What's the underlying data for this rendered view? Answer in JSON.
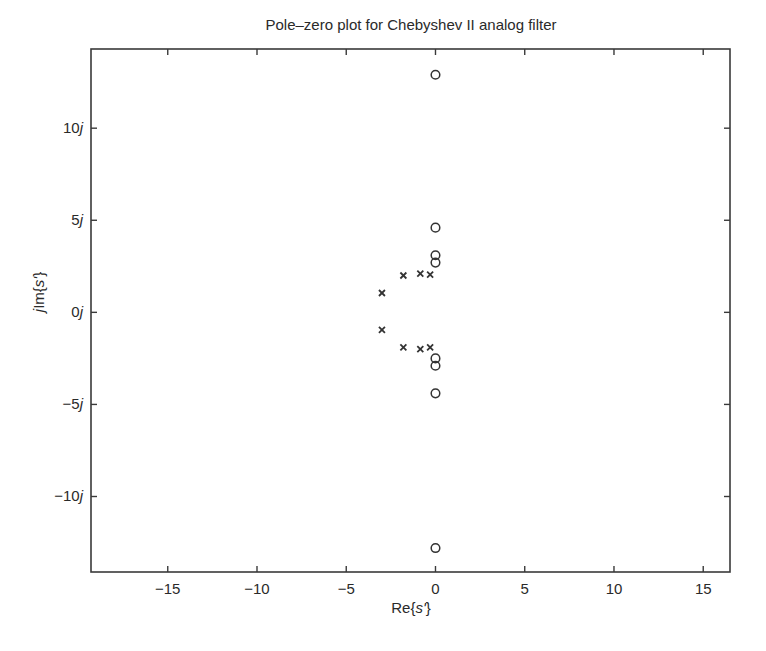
{
  "chart_data": {
    "type": "scatter",
    "title": "Pole–zero plot for Chebyshev II analog filter",
    "xlabel": "Re{s'}",
    "ylabel": "jIm{s'}",
    "xlim": [
      -19.3,
      16.5
    ],
    "ylim": [
      -14.1,
      14.3
    ],
    "xticks": [
      -15,
      -10,
      -5,
      0,
      5,
      10,
      15
    ],
    "xtick_labels": [
      "−15",
      "−10",
      "−5",
      "0",
      "5",
      "10",
      "15"
    ],
    "yticks": [
      10,
      5,
      0,
      -5,
      -10
    ],
    "ytick_labels": [
      "10j",
      "5j",
      "0j",
      "−5j",
      "−10j"
    ],
    "grid": false,
    "legend": null,
    "series": [
      {
        "name": "zeros",
        "marker": "o",
        "points": [
          [
            0,
            12.9
          ],
          [
            0,
            4.6
          ],
          [
            0,
            3.1
          ],
          [
            0,
            2.7
          ],
          [
            0,
            -2.5
          ],
          [
            0,
            -2.9
          ],
          [
            0,
            -4.4
          ],
          [
            0,
            -12.8
          ]
        ]
      },
      {
        "name": "poles",
        "marker": "x",
        "points": [
          [
            -3.0,
            1.05
          ],
          [
            -1.8,
            2.0
          ],
          [
            -0.85,
            2.1
          ],
          [
            -0.3,
            2.05
          ],
          [
            -3.0,
            -0.95
          ],
          [
            -1.8,
            -1.9
          ],
          [
            -0.85,
            -2.0
          ],
          [
            -0.3,
            -1.9
          ]
        ]
      }
    ]
  }
}
